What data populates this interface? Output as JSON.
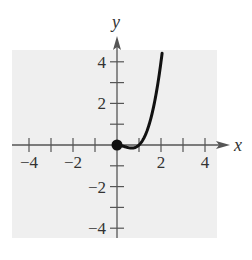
{
  "chart_data": {
    "type": "line",
    "title": "",
    "xlabel": "x",
    "ylabel": "y",
    "xlim": [
      -4.5,
      4.5
    ],
    "ylim": [
      -4.5,
      4.5
    ],
    "x_ticks": [
      -4,
      -3,
      -2,
      -1,
      1,
      2,
      3,
      4
    ],
    "y_ticks": [
      -4,
      -3,
      -2,
      -1,
      1,
      2,
      3,
      4
    ],
    "x_tick_labels": [
      {
        "value": -4,
        "label": "−4"
      },
      {
        "value": -2,
        "label": "−2"
      },
      {
        "value": 2,
        "label": "2"
      },
      {
        "value": 4,
        "label": "4"
      }
    ],
    "y_tick_labels": [
      {
        "value": 4,
        "label": "4"
      },
      {
        "value": 2,
        "label": "2"
      },
      {
        "value": -2,
        "label": "−2"
      },
      {
        "value": -4,
        "label": "−4"
      }
    ],
    "grid": false,
    "background_color": "#efefef",
    "line_color": "#111111",
    "series": [
      {
        "name": "f(x)",
        "description": "Curve starting at closed point (0,0), dipping to a minimum near (0.67,-0.15), crossing zero at x=1 and rising steeply through (2,4)",
        "x": [
          0,
          0.2,
          0.4,
          0.6,
          0.67,
          0.8,
          1.0,
          1.2,
          1.4,
          1.6,
          1.8,
          2.0,
          2.05
        ],
        "y": [
          0,
          -0.032,
          -0.096,
          -0.144,
          -0.148,
          -0.128,
          0,
          0.288,
          0.784,
          1.536,
          2.592,
          4.0,
          4.41
        ]
      }
    ],
    "points": [
      {
        "x": 0,
        "y": 0,
        "style": "closed-dot"
      }
    ]
  }
}
